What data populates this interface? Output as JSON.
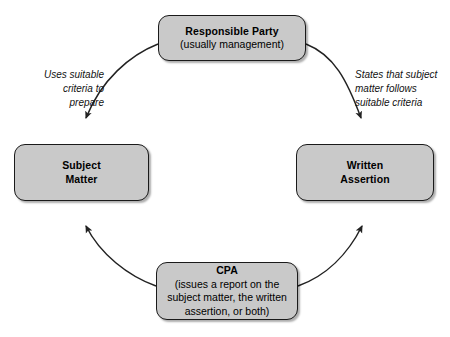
{
  "diagram": {
    "type": "cycle-diagram",
    "background_color": "#ffffff",
    "node_fill_color": "#c9c9c9",
    "node_border_color": "#1a1a1a",
    "arc_color": "#222222",
    "nodes": {
      "responsible_party": {
        "title": "Responsible Party",
        "subtitle": "(usually management)"
      },
      "subject_matter": {
        "line1": "Subject",
        "line2": "Matter"
      },
      "written_assertion": {
        "line1": "Written",
        "line2": "Assertion"
      },
      "cpa": {
        "title": "CPA",
        "line1": "(issues a report on the",
        "line2": "subject matter, the written",
        "line3": "assertion, or both)"
      }
    },
    "edge_labels": {
      "left": {
        "line1": "Uses suitable",
        "line2": "criteria to",
        "line3": "prepare"
      },
      "right": {
        "line1": "States that subject",
        "line2": "matter follows",
        "line3": "suitable criteria"
      }
    }
  }
}
